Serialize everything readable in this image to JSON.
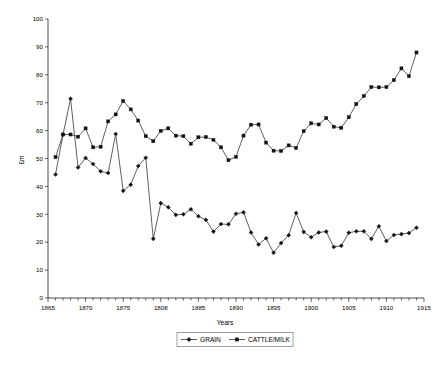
{
  "chart_data": {
    "type": "line",
    "title": "",
    "xlabel": "Years",
    "ylabel": "£m",
    "xlim": [
      1865,
      1915
    ],
    "ylim": [
      0,
      100
    ],
    "grid": false,
    "legend_position": "bottom-center",
    "x_tick_labels": [
      "1865",
      "1870",
      "1875",
      "1808",
      "1885",
      "1890",
      "1895",
      "1900",
      "1905",
      "1910",
      "1915"
    ],
    "x_tick_values": [
      1865,
      1870,
      1875,
      1880,
      1885,
      1890,
      1895,
      1900,
      1905,
      1910,
      1915
    ],
    "y_tick_labels": [
      "0",
      "10",
      "20",
      "30",
      "40",
      "50",
      "60",
      "70",
      "80",
      "90",
      "100"
    ],
    "y_tick_values": [
      0,
      10,
      20,
      30,
      40,
      50,
      60,
      70,
      80,
      90,
      100
    ],
    "x": [
      1866,
      1867,
      1868,
      1869,
      1870,
      1871,
      1872,
      1873,
      1874,
      1875,
      1876,
      1877,
      1878,
      1879,
      1880,
      1881,
      1882,
      1883,
      1884,
      1885,
      1886,
      1887,
      1888,
      1889,
      1890,
      1891,
      1892,
      1893,
      1894,
      1895,
      1896,
      1897,
      1898,
      1899,
      1900,
      1901,
      1902,
      1903,
      1904,
      1905,
      1906,
      1907,
      1908,
      1909,
      1910,
      1911,
      1912,
      1913,
      1914
    ],
    "series": [
      {
        "name": "GRAIN",
        "marker": "diamond",
        "color": "#111111",
        "values": [
          44.3,
          58.6,
          71.4,
          46.8,
          50.2,
          48.0,
          45.4,
          44.8,
          58.8,
          38.4,
          40.6,
          47.3,
          50.3,
          21.2,
          34.0,
          32.5,
          29.8,
          30.0,
          31.8,
          29.3,
          28.0,
          23.8,
          26.5,
          26.4,
          30.2,
          30.7,
          23.5,
          19.2,
          21.4,
          16.2,
          19.7,
          22.5,
          30.5,
          23.7,
          21.8,
          23.5,
          23.8,
          18.3,
          18.7,
          23.4,
          23.9,
          23.9,
          21.2,
          25.7,
          20.4,
          22.6,
          22.9,
          23.3,
          25.2
        ]
      },
      {
        "name": "CATTLE/MILK",
        "marker": "square",
        "color": "#111111",
        "values": [
          50.5,
          58.6,
          58.6,
          57.8,
          60.8,
          54.0,
          54.2,
          63.3,
          65.8,
          70.6,
          67.6,
          63.6,
          58.0,
          56.2,
          59.9,
          60.8,
          58.2,
          58.0,
          55.3,
          57.6,
          57.7,
          56.7,
          54.0,
          49.4,
          50.6,
          58.2,
          62.1,
          62.2,
          55.7,
          52.8,
          52.7,
          54.7,
          53.8,
          59.8,
          62.6,
          62.2,
          64.5,
          61.4,
          61.0,
          64.8,
          69.5,
          72.4,
          75.6,
          75.5,
          75.6,
          78.1,
          82.3,
          79.5,
          88.0
        ]
      }
    ]
  },
  "legend": {
    "items": [
      {
        "label": "GRAIN",
        "marker": "diamond"
      },
      {
        "label": "CATTLE/MILK",
        "marker": "square"
      }
    ]
  },
  "axes": {
    "y_title": "£m",
    "x_title": "Years"
  }
}
